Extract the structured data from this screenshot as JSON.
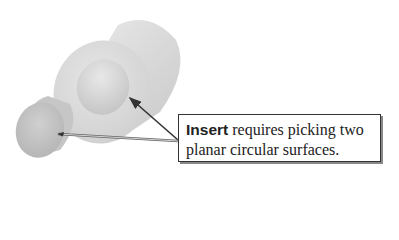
{
  "diagram": {
    "callout": {
      "keyword": "Insert",
      "line1_rest": " requires picking two",
      "line2": "planar circular surfaces."
    },
    "arrows": [
      {
        "target": "inner-circular-face-large-cylinder"
      },
      {
        "target": "end-face-small-cylinder"
      }
    ],
    "colors": {
      "surface_light": "#e2e2e2",
      "surface_dark": "#bdbdbd",
      "arrow": "#333333"
    }
  }
}
